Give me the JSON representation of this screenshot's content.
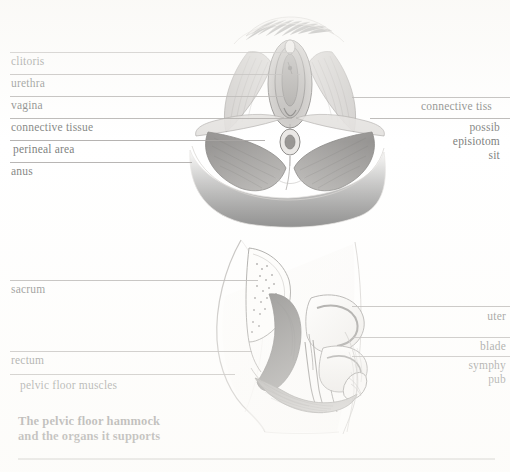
{
  "document": {
    "kind": "anatomical-illustration-page",
    "caption": "The pelvic floor hammock\nand the organs it supports"
  },
  "colors": {
    "paper": "#ffffff",
    "ink": "#231f1c",
    "leader_line": "#6e6a66",
    "rule": "#9a9893",
    "pencil_dark": "#2b2b2b",
    "pencil_mid": "#6f6f6f",
    "pencil_light": "#b9b9b9"
  },
  "figures": [
    {
      "id": "perineum-from-below",
      "view": "external view of the female perineum from below",
      "labels_left": [
        {
          "text": "clitoris",
          "y": 62,
          "line_y": 52,
          "line_x1": 10,
          "line_x2": 293
        },
        {
          "text": "urethra",
          "y": 84,
          "line_y": 74,
          "line_x1": 10,
          "line_x2": 300
        },
        {
          "text": "vagina",
          "y": 106,
          "line_y": 96,
          "line_x1": 10,
          "line_x2": 296
        },
        {
          "text": "connective tissue",
          "y": 128,
          "line_y": 118,
          "line_x1": 10,
          "line_x2": 292
        },
        {
          "text": "perineal area",
          "y": 150,
          "line_y": 140,
          "line_x1": 10,
          "line_x2": 265
        },
        {
          "text": "anus",
          "y": 172,
          "line_y": 162,
          "line_x1": 10,
          "line_x2": 192
        }
      ],
      "labels_right": [
        {
          "text": "connective tiss",
          "y": 104,
          "line_y": 97,
          "line_x1": 352,
          "line_x2": 510,
          "clipped": true
        },
        {
          "text": "possib",
          "y": 124,
          "line_y": 118,
          "line_x1": 370,
          "line_x2": 510,
          "clipped": true
        },
        {
          "text": "episiotom",
          "y": 138,
          "clipped": true
        },
        {
          "text": "sit",
          "y": 152,
          "clipped": true
        }
      ]
    },
    {
      "id": "pelvic-sagittal-section",
      "view": "side (sagittal) section of the pelvis showing the organs resting on the pelvic floor",
      "labels_left": [
        {
          "text": "sacrum",
          "y": 290,
          "line_y": 280,
          "line_x1": 10,
          "line_x2": 258
        },
        {
          "text": "rectum",
          "y": 361,
          "line_y": 351,
          "line_x1": 10,
          "line_x2": 252
        },
        {
          "text": "pelvic floor muscles",
          "y": 386,
          "line_y": 374,
          "line_x1": 10,
          "line_x2": 235
        }
      ],
      "labels_right": [
        {
          "text": "uter",
          "y": 315,
          "line_y": 306,
          "line_x1": 352,
          "line_x2": 510,
          "clipped": true
        },
        {
          "text": "blade",
          "y": 345,
          "line_y": 337,
          "line_x1": 352,
          "line_x2": 510,
          "clipped": true
        },
        {
          "text": "symphy",
          "y": 364,
          "line_y": 356,
          "line_x1": 352,
          "line_x2": 510,
          "clipped": true
        },
        {
          "text": "pub",
          "y": 378,
          "clipped": true
        }
      ]
    }
  ],
  "footer_rule": {
    "y": 458,
    "x1": 18,
    "x2": 495
  }
}
